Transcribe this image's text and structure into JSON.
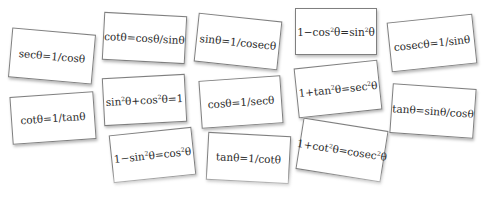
{
  "cards": [
    {
      "id": "sec",
      "parts": [
        "secθ=1/cosθ"
      ],
      "left": 10,
      "top": 31,
      "width": 84,
      "height": 50,
      "rotate": 5
    },
    {
      "id": "cot-cos-sin",
      "parts": [
        "cotθ=cosθ/sinθ"
      ],
      "left": 103,
      "top": 14,
      "width": 83,
      "height": 48,
      "rotate": 3
    },
    {
      "id": "sin-cosec",
      "parts": [
        "sinθ=1/cosecθ"
      ],
      "left": 196,
      "top": 17,
      "width": 84,
      "height": 49,
      "rotate": 6
    },
    {
      "id": "one-minus-cos2",
      "parts": [
        "1−cos",
        "2",
        "θ=sin",
        "2",
        "θ"
      ],
      "left": 295,
      "top": 8,
      "width": 82,
      "height": 47,
      "rotate": 0
    },
    {
      "id": "cosec",
      "parts": [
        "cosecθ=1/sinθ"
      ],
      "left": 389,
      "top": 18,
      "width": 86,
      "height": 50,
      "rotate": -6
    },
    {
      "id": "cot-tan",
      "parts": [
        "cotθ=1/tanθ"
      ],
      "left": 11,
      "top": 94,
      "width": 84,
      "height": 48,
      "rotate": -4
    },
    {
      "id": "pythag",
      "parts": [
        "sin",
        "2",
        "θ+cos",
        "2",
        "θ=1"
      ],
      "left": 103,
      "top": 76,
      "width": 83,
      "height": 48,
      "rotate": -3
    },
    {
      "id": "cos-sec",
      "parts": [
        "cosθ=1/secθ"
      ],
      "left": 200,
      "top": 78,
      "width": 82,
      "height": 48,
      "rotate": -4
    },
    {
      "id": "one-plus-tan2",
      "parts": [
        "1+tan",
        "2",
        "θ=sec",
        "2",
        "θ"
      ],
      "left": 296,
      "top": 64,
      "width": 84,
      "height": 50,
      "rotate": -6
    },
    {
      "id": "tan-sin-cos",
      "parts": [
        "tanθ=sinθ/cosθ"
      ],
      "left": 391,
      "top": 86,
      "width": 84,
      "height": 50,
      "rotate": 4
    },
    {
      "id": "one-minus-sin2",
      "parts": [
        "1−sin",
        "2",
        "θ=cos",
        "2",
        "θ"
      ],
      "left": 111,
      "top": 131,
      "width": 83,
      "height": 48,
      "rotate": -6
    },
    {
      "id": "tan-cot",
      "parts": [
        "tanθ=1/cotθ"
      ],
      "left": 207,
      "top": 134,
      "width": 83,
      "height": 48,
      "rotate": 3
    },
    {
      "id": "one-plus-cot2",
      "parts": [
        "1+cot",
        "2",
        "θ=cosec",
        "2",
        "θ"
      ],
      "left": 299,
      "top": 124,
      "width": 86,
      "height": 52,
      "rotate": 9
    }
  ]
}
